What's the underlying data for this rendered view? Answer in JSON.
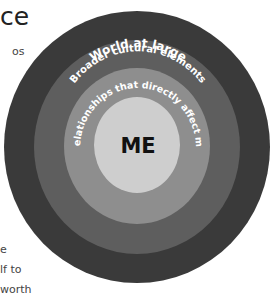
{
  "page": {
    "title_fragment": "ce",
    "body_fragments": [
      {
        "text": "os",
        "x": 12,
        "y": 47
      },
      {
        "text": "e",
        "x": 0,
        "y": 244
      },
      {
        "text": "lf to",
        "x": 0,
        "y": 265
      },
      {
        "text": "worth",
        "x": 0,
        "y": 285
      }
    ]
  },
  "diagram": {
    "type": "concentric-circles",
    "rings": [
      {
        "label": "World at large",
        "color": "#3a3a3a"
      },
      {
        "label": "Broader cultural elements",
        "color": "#5e5e5e"
      },
      {
        "label": "Relationships that directly affect me",
        "color": "#8e8e8e"
      },
      {
        "label": "ME",
        "color": "#cecece"
      }
    ],
    "center_label": "ME"
  }
}
